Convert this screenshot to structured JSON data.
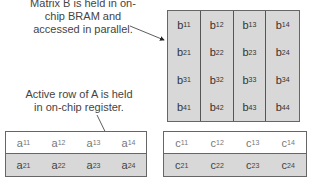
{
  "annotations": {
    "matrix_b_note": [
      "Matrix B is held in on-",
      "chip BRAM and",
      "accessed in parallel."
    ],
    "row_a_note": [
      "Active row of A is held",
      "in on-chip register."
    ]
  },
  "matrix_b": {
    "rows": [
      [
        {
          "v": "b",
          "s": "11"
        },
        {
          "v": "b",
          "s": "12"
        },
        {
          "v": "b",
          "s": "13"
        },
        {
          "v": "b",
          "s": "14"
        }
      ],
      [
        {
          "v": "b",
          "s": "21"
        },
        {
          "v": "b",
          "s": "22"
        },
        {
          "v": "b",
          "s": "23"
        },
        {
          "v": "b",
          "s": "24"
        }
      ],
      [
        {
          "v": "b",
          "s": "31"
        },
        {
          "v": "b",
          "s": "32"
        },
        {
          "v": "b",
          "s": "33"
        },
        {
          "v": "b",
          "s": "34"
        }
      ],
      [
        {
          "v": "b",
          "s": "41"
        },
        {
          "v": "b",
          "s": "42"
        },
        {
          "v": "b",
          "s": "43"
        },
        {
          "v": "b",
          "s": "44"
        }
      ]
    ]
  },
  "matrix_a": {
    "rows": [
      [
        {
          "v": "a",
          "s": "11"
        },
        {
          "v": "a",
          "s": "12"
        },
        {
          "v": "a",
          "s": "13"
        },
        {
          "v": "a",
          "s": "14"
        }
      ],
      [
        {
          "v": "a",
          "s": "21"
        },
        {
          "v": "a",
          "s": "22"
        },
        {
          "v": "a",
          "s": "23"
        },
        {
          "v": "a",
          "s": "24"
        }
      ]
    ]
  },
  "matrix_c": {
    "rows": [
      [
        {
          "v": "c",
          "s": "11"
        },
        {
          "v": "c",
          "s": "12"
        },
        {
          "v": "c",
          "s": "13"
        },
        {
          "v": "c",
          "s": "14"
        }
      ],
      [
        {
          "v": "c",
          "s": "21"
        },
        {
          "v": "c",
          "s": "22"
        },
        {
          "v": "c",
          "s": "23"
        },
        {
          "v": "c",
          "s": "24"
        }
      ]
    ]
  }
}
